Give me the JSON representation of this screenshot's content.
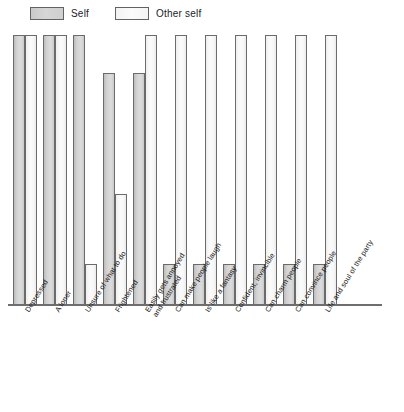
{
  "legend": {
    "entries": [
      {
        "label": "Self",
        "key": "self",
        "color": "#d3d3d3"
      },
      {
        "label": "Other self",
        "key": "other",
        "color": "#f7f7f7"
      }
    ]
  },
  "chart_data": {
    "type": "bar",
    "title": "",
    "xlabel": "",
    "ylabel": "",
    "ylim": [
      0,
      100
    ],
    "grid": false,
    "legend_position": "top-left",
    "orientation": "vertical",
    "categories": [
      "Depressed",
      "A loner",
      "Unsure of what to do",
      "Frightened",
      "Easily gets annoyed and frustrated",
      "Can make people laugh",
      "Is like a fantasy",
      "Confident, invincible",
      "Can charm people",
      "Can convince people",
      "Life and soul of the party"
    ],
    "categories_wrapped": [
      [
        "Depressed",
        ""
      ],
      [
        "A loner",
        ""
      ],
      [
        "Unsure of what to do",
        ""
      ],
      [
        "Frightened",
        ""
      ],
      [
        "Easily gets annoyed",
        "and frustrated"
      ],
      [
        "Can make people laugh",
        ""
      ],
      [
        "Is like a fantasy",
        ""
      ],
      [
        "Confident, invincible",
        ""
      ],
      [
        "Can charm people",
        ""
      ],
      [
        "Can convince people",
        ""
      ],
      [
        "Life and soul of the party",
        ""
      ]
    ],
    "series": [
      {
        "name": "Self",
        "key": "self",
        "color": "#d3d3d3",
        "values": [
          100,
          100,
          100,
          86,
          86,
          15,
          15,
          15,
          15,
          15,
          15
        ]
      },
      {
        "name": "Other self",
        "key": "other",
        "color": "#f7f7f7",
        "values": [
          100,
          100,
          15,
          41,
          100,
          100,
          100,
          100,
          100,
          100,
          100
        ]
      }
    ]
  }
}
